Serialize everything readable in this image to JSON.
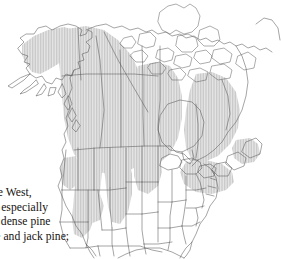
{
  "figure": {
    "name": "north-america-species-range-map",
    "type": "distribution-map",
    "region": "North America",
    "background_color": "#ffffff",
    "outline_color": "#555555",
    "range_fill_color": "#d9d9d9",
    "range_hatch_color": "#c8c8c8",
    "water_fill_color": "#ffffff",
    "areas": [
      {
        "label": "Alaska",
        "shaded": true
      },
      {
        "label": "Yukon",
        "shaded": true
      },
      {
        "label": "British Columbia",
        "shaded": true
      },
      {
        "label": "Northwest Territories",
        "shaded": true
      },
      {
        "label": "Alberta",
        "shaded": true
      },
      {
        "label": "Saskatchewan",
        "shaded": true
      },
      {
        "label": "Manitoba",
        "shaded": true
      },
      {
        "label": "Ontario",
        "shaded": true
      },
      {
        "label": "Quebec",
        "shaded": true
      },
      {
        "label": "Newfoundland and Labrador",
        "shaded": true
      },
      {
        "label": "Maritimes",
        "shaded": true
      },
      {
        "label": "Canadian Arctic Archipelago",
        "shaded": false
      },
      {
        "label": "Hudson Bay",
        "shaded": false
      },
      {
        "label": "Western United States mountains",
        "shaded": true
      },
      {
        "label": "Northeastern United States",
        "shaded": true
      },
      {
        "label": "Southeastern United States",
        "shaded": false
      },
      {
        "label": "Mexico",
        "shaded": false
      }
    ]
  },
  "caption": {
    "name": "figure-caption",
    "lines": [
      "ne West,",
      "t, especially",
      "n dense pine",
      "le and jack pine;"
    ]
  }
}
